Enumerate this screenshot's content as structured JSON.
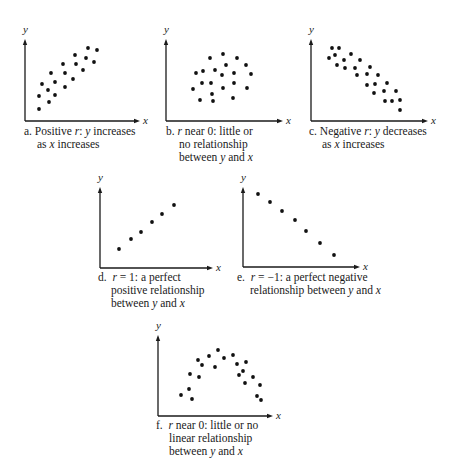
{
  "figure": {
    "panels": [
      {
        "id": "a",
        "caption": [
          "a. Positive r: y increases",
          "as x increases"
        ],
        "x_label": "x",
        "y_label": "y",
        "axes": {
          "ox": 25,
          "oy": 121,
          "top": 39,
          "right": 140
        },
        "points": [
          [
            39,
            109
          ],
          [
            39,
            96
          ],
          [
            42,
            84
          ],
          [
            49,
            102
          ],
          [
            48,
            90
          ],
          [
            55,
            95
          ],
          [
            51,
            73
          ],
          [
            55,
            82
          ],
          [
            63,
            64
          ],
          [
            65,
            73
          ],
          [
            65,
            87
          ],
          [
            75,
            55
          ],
          [
            76,
            64
          ],
          [
            73,
            79
          ],
          [
            83,
            70
          ],
          [
            88,
            48
          ],
          [
            86,
            58
          ],
          [
            97,
            50
          ],
          [
            94,
            62
          ]
        ],
        "caption_pos": {
          "x": 24,
          "y": 125
        }
      },
      {
        "id": "b",
        "caption": [
          "b. r near 0: little or",
          "no relationship",
          "between y and x"
        ],
        "x_label": "x",
        "y_label": "y",
        "axes": {
          "ox": 166,
          "oy": 121,
          "top": 39,
          "right": 283
        },
        "points": [
          [
            210,
            58
          ],
          [
            223,
            54
          ],
          [
            237,
            58
          ],
          [
            226,
            65
          ],
          [
            246,
            65
          ],
          [
            196,
            73
          ],
          [
            203,
            71
          ],
          [
            215,
            70
          ],
          [
            222,
            75
          ],
          [
            234,
            73
          ],
          [
            251,
            74
          ],
          [
            202,
            83
          ],
          [
            211,
            83
          ],
          [
            234,
            83
          ],
          [
            193,
            89
          ],
          [
            223,
            88
          ],
          [
            247,
            88
          ],
          [
            212,
            94
          ],
          [
            200,
            100
          ],
          [
            213,
            101
          ],
          [
            233,
            98
          ]
        ],
        "caption_pos": {
          "x": 166,
          "y": 125
        }
      },
      {
        "id": "c",
        "caption": [
          "c. Negative r: y decreases",
          "as x increases"
        ],
        "x_label": "x",
        "y_label": "y",
        "axes": {
          "ox": 311,
          "oy": 121,
          "top": 39,
          "right": 428
        },
        "points": [
          [
            332,
            48
          ],
          [
            339,
            48
          ],
          [
            335,
            55
          ],
          [
            329,
            58
          ],
          [
            351,
            54
          ],
          [
            344,
            60
          ],
          [
            360,
            60
          ],
          [
            337,
            65
          ],
          [
            345,
            68
          ],
          [
            355,
            68
          ],
          [
            370,
            67
          ],
          [
            357,
            75
          ],
          [
            367,
            74
          ],
          [
            378,
            75
          ],
          [
            367,
            85
          ],
          [
            375,
            84
          ],
          [
            387,
            83
          ],
          [
            374,
            93
          ],
          [
            384,
            91
          ],
          [
            396,
            91
          ],
          [
            385,
            101
          ],
          [
            392,
            101
          ],
          [
            400,
            100
          ],
          [
            400,
            110
          ]
        ],
        "caption_pos": {
          "x": 309,
          "y": 125
        }
      },
      {
        "id": "d",
        "caption": [
          "d.  r = 1: a perfect",
          "positive relationship",
          "between y and x"
        ],
        "x_label": "x",
        "y_label": "y",
        "axes": {
          "ox": 100,
          "oy": 268,
          "top": 187,
          "right": 213
        },
        "points": [
          [
            119,
            249
          ],
          [
            131,
            239
          ],
          [
            141,
            232
          ],
          [
            152,
            222
          ],
          [
            162,
            214
          ],
          [
            174,
            205
          ]
        ],
        "caption_pos": {
          "x": 98,
          "y": 271
        }
      },
      {
        "id": "e",
        "caption": [
          "e.  r = −1: a perfect negative",
          "relationship between y and x"
        ],
        "x_label": "x",
        "y_label": "y",
        "axes": {
          "ox": 243,
          "oy": 267,
          "top": 187,
          "right": 360
        },
        "points": [
          [
            258,
            194
          ],
          [
            270,
            202
          ],
          [
            282,
            211
          ],
          [
            295,
            220
          ],
          [
            306,
            231
          ],
          [
            320,
            243
          ],
          [
            334,
            255
          ]
        ],
        "caption_pos": {
          "x": 237,
          "y": 271
        }
      },
      {
        "id": "f",
        "caption": [
          "f.  r near 0: little or no",
          "linear relationship",
          "between y and x"
        ],
        "x_label": "x",
        "y_label": "y",
        "axes": {
          "ox": 158,
          "oy": 416,
          "top": 335,
          "right": 273
        },
        "points": [
          [
            181,
            395
          ],
          [
            189,
            389
          ],
          [
            192,
            399
          ],
          [
            190,
            374
          ],
          [
            199,
            377
          ],
          [
            198,
            360
          ],
          [
            202,
            365
          ],
          [
            209,
            356
          ],
          [
            215,
            367
          ],
          [
            218,
            350
          ],
          [
            224,
            358
          ],
          [
            233,
            355
          ],
          [
            237,
            364
          ],
          [
            246,
            362
          ],
          [
            243,
            371
          ],
          [
            239,
            375
          ],
          [
            245,
            383
          ],
          [
            253,
            377
          ],
          [
            260,
            385
          ],
          [
            257,
            396
          ],
          [
            261,
            400
          ]
        ],
        "caption_pos": {
          "x": 156,
          "y": 419
        }
      }
    ]
  },
  "chart_data": [
    {
      "type": "scatter",
      "title": "a. Positive r: y increases as x increases",
      "xlabel": "x",
      "ylabel": "y",
      "grid": false,
      "relationship": "positive",
      "x": [
        14,
        14,
        17,
        24,
        23,
        30,
        26,
        30,
        38,
        40,
        40,
        50,
        51,
        48,
        58,
        63,
        61,
        72,
        69
      ],
      "y": [
        12,
        25,
        37,
        19,
        31,
        26,
        48,
        39,
        57,
        48,
        34,
        66,
        57,
        42,
        51,
        73,
        63,
        71,
        59
      ]
    },
    {
      "type": "scatter",
      "title": "b. r near 0: little or no relationship between y and x",
      "xlabel": "x",
      "ylabel": "y",
      "grid": false,
      "relationship": "none",
      "x": [
        44,
        57,
        71,
        60,
        80,
        30,
        37,
        49,
        56,
        68,
        85,
        36,
        45,
        68,
        27,
        57,
        81,
        46,
        34,
        47,
        67
      ],
      "y": [
        63,
        67,
        63,
        56,
        56,
        48,
        50,
        51,
        46,
        48,
        47,
        38,
        38,
        38,
        32,
        33,
        33,
        27,
        21,
        20,
        23
      ]
    },
    {
      "type": "scatter",
      "title": "c. Negative r: y decreases as x increases",
      "xlabel": "x",
      "ylabel": "y",
      "grid": false,
      "relationship": "negative",
      "x": [
        21,
        28,
        24,
        18,
        40,
        33,
        49,
        26,
        34,
        44,
        59,
        46,
        56,
        67,
        56,
        64,
        76,
        63,
        73,
        85,
        74,
        81,
        89,
        89
      ],
      "y": [
        73,
        73,
        66,
        63,
        67,
        61,
        61,
        56,
        53,
        53,
        54,
        46,
        47,
        46,
        36,
        37,
        38,
        28,
        30,
        30,
        20,
        20,
        21,
        11
      ]
    },
    {
      "type": "scatter",
      "title": "d. r = 1: a perfect positive relationship between y and x",
      "xlabel": "x",
      "ylabel": "y",
      "grid": false,
      "relationship": "perfect positive",
      "x": [
        19,
        31,
        41,
        52,
        62,
        74
      ],
      "y": [
        19,
        29,
        36,
        46,
        54,
        63
      ]
    },
    {
      "type": "scatter",
      "title": "e. r = −1: a perfect negative relationship between y and x",
      "xlabel": "x",
      "ylabel": "y",
      "grid": false,
      "relationship": "perfect negative",
      "x": [
        15,
        27,
        39,
        52,
        63,
        77,
        91
      ],
      "y": [
        73,
        65,
        56,
        47,
        36,
        24,
        12
      ]
    },
    {
      "type": "scatter",
      "title": "f. r near 0: little or no linear relationship between y and x",
      "xlabel": "x",
      "ylabel": "y",
      "grid": false,
      "relationship": "curvilinear (inverted U)",
      "x": [
        23,
        31,
        34,
        32,
        41,
        40,
        44,
        51,
        57,
        60,
        66,
        75,
        79,
        88,
        85,
        81,
        87,
        95,
        102,
        99,
        103
      ],
      "y": [
        21,
        27,
        17,
        42,
        39,
        56,
        51,
        60,
        49,
        66,
        58,
        61,
        52,
        54,
        45,
        41,
        33,
        39,
        31,
        20,
        16
      ]
    }
  ]
}
